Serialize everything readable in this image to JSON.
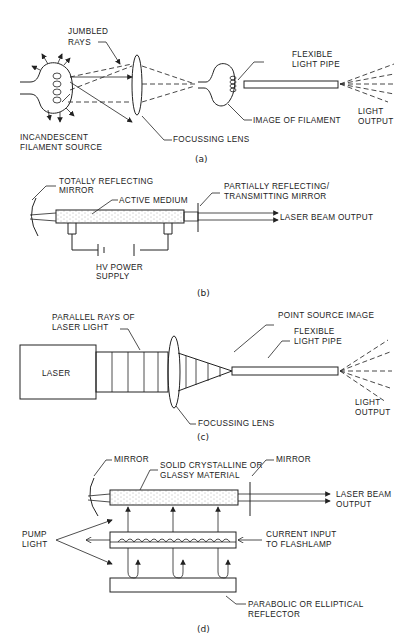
{
  "figure": {
    "panel_a": {
      "caption": "(a)",
      "labels": {
        "jumbled_rays_1": "JUMBLED",
        "jumbled_rays_2": "RAYS",
        "source_1": "INCANDESCENT",
        "source_2": "FILAMENT SOURCE",
        "lens": "FOCUSSING LENS",
        "image": "IMAGE OF FILAMENT",
        "pipe_1": "FLEXIBLE",
        "pipe_2": "LIGHT PIPE",
        "output_1": "LIGHT",
        "output_2": "OUTPUT"
      }
    },
    "panel_b": {
      "caption": "(b)",
      "labels": {
        "mirror_1": "TOTALLY REFLECTING",
        "mirror_2": "MIRROR",
        "medium": "ACTIVE MEDIUM",
        "partial_1": "PARTIALLY REFLECTING/",
        "partial_2": "TRANSMITTING MIRROR",
        "beam": "LASER BEAM OUTPUT",
        "power_1": "HV POWER",
        "power_2": "SUPPLY"
      }
    },
    "panel_c": {
      "caption": "(c)",
      "labels": {
        "laser": "LASER",
        "rays_1": "PARALLEL RAYS OF",
        "rays_2": "LASER LIGHT",
        "point": "POINT SOURCE IMAGE",
        "pipe_1": "FLEXIBLE",
        "pipe_2": "LIGHT PIPE",
        "lens": "FOCUSSING LENS",
        "output_1": "LIGHT",
        "output_2": "OUTPUT"
      }
    },
    "panel_d": {
      "caption": "(d)",
      "labels": {
        "mirror_left": "MIRROR",
        "material_1": "SOLID CRYSTALLINE OR",
        "material_2": "GLASSY MATERIAL",
        "mirror_right": "MIRROR",
        "beam_1": "LASER BEAM",
        "beam_2": "OUTPUT",
        "pump_1": "PUMP",
        "pump_2": "LIGHT",
        "current_1": "CURRENT INPUT",
        "current_2": "TO FLASHLAMP",
        "reflector_1": "PARABOLIC OR ELLIPTICAL",
        "reflector_2": "REFLECTOR"
      }
    }
  }
}
